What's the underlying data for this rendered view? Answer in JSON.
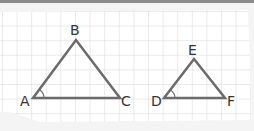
{
  "diagram": {
    "colors": {
      "line": "#6b6b6b",
      "grid": "#d8d8d8",
      "paper": "#ffffff"
    },
    "triangles": [
      {
        "name": "ABC",
        "vertices": {
          "A": "A",
          "B": "B",
          "C": "C"
        },
        "angle_marked": "A"
      },
      {
        "name": "DEF",
        "vertices": {
          "D": "D",
          "E": "E",
          "F": "F"
        },
        "angle_marked": "D"
      }
    ],
    "labels": {
      "A": "A",
      "B": "B",
      "C": "C",
      "D": "D",
      "E": "E",
      "F": "F"
    }
  }
}
